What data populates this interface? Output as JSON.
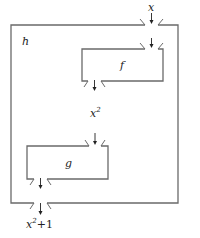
{
  "diagram": {
    "outer_box": {
      "label": "h"
    },
    "inner_boxes": [
      {
        "label": "f"
      },
      {
        "label": "g"
      }
    ],
    "input_label": "x",
    "intermediate_label": {
      "base": "x",
      "exp": "2"
    },
    "output_label": {
      "base": "x",
      "exp": "2",
      "rest": "+1"
    },
    "colors": {
      "stroke": "#6a6a6a",
      "text": "#222222",
      "background": "#ffffff"
    }
  }
}
